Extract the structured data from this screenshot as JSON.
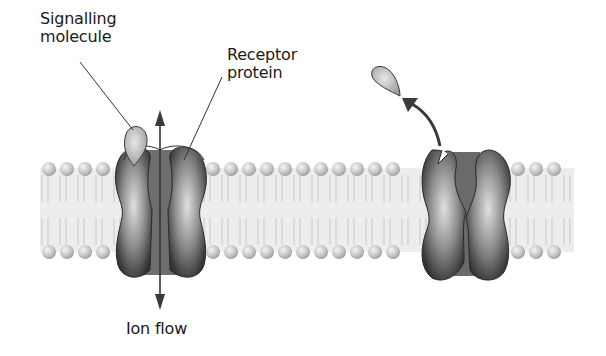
{
  "labels": {
    "signalling_molecule": {
      "line1": "Signalling",
      "line2": "molecule"
    },
    "receptor_protein": {
      "line1": "Receptor",
      "line2": "protein"
    },
    "ion_flow": "Ion flow"
  },
  "colors": {
    "background": "#ffffff",
    "membrane_fill": "#ececec",
    "lipid_head": "#c8c8c8",
    "protein_dark": "#4a4a4a",
    "protein_light": "#d0d0d0",
    "arrow": "#3a3a3a",
    "text": "#1a1a1a"
  },
  "diagram": {
    "states": [
      {
        "name": "open-channel",
        "ligand_bound": true,
        "ion_flow": true
      },
      {
        "name": "closed-channel",
        "ligand_bound": false,
        "ion_flow": false
      }
    ]
  }
}
